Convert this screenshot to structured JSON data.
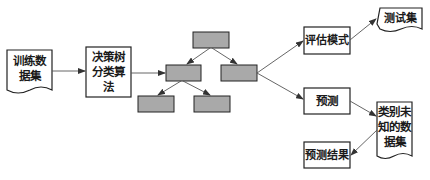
{
  "diagram": {
    "nodes": {
      "training_data": {
        "label": "训练数\n据集",
        "shape": "document"
      },
      "decision_tree_algo": {
        "label": "决策树\n分类算\n法",
        "shape": "rectangle"
      },
      "tree_root": {
        "label": "",
        "shape": "filled-rectangle"
      },
      "tree_left": {
        "label": "",
        "shape": "filled-rectangle"
      },
      "tree_right": {
        "label": "",
        "shape": "filled-rectangle"
      },
      "tree_left_left": {
        "label": "",
        "shape": "filled-rectangle"
      },
      "tree_left_right": {
        "label": "",
        "shape": "filled-rectangle"
      },
      "evaluate_model": {
        "label": "评估模式",
        "shape": "rectangle"
      },
      "test_set": {
        "label": "测试集",
        "shape": "document"
      },
      "predict": {
        "label": "预测",
        "shape": "rectangle"
      },
      "unknown_class_data": {
        "label": "类别未\n知的数\n据集",
        "shape": "document"
      },
      "prediction_result": {
        "label": "预测结果",
        "shape": "rectangle"
      }
    },
    "edges": [
      {
        "from": "training_data",
        "to": "decision_tree_algo"
      },
      {
        "from": "decision_tree_algo",
        "to": "tree_left"
      },
      {
        "from": "tree_root",
        "to": "tree_left"
      },
      {
        "from": "tree_root",
        "to": "tree_right"
      },
      {
        "from": "tree_left",
        "to": "tree_left_left"
      },
      {
        "from": "tree_left",
        "to": "tree_left_right"
      },
      {
        "from": "tree_right",
        "to": "evaluate_model"
      },
      {
        "from": "tree_right",
        "to": "predict"
      },
      {
        "from": "evaluate_model",
        "to": "test_set"
      },
      {
        "from": "predict",
        "to": "unknown_class_data"
      },
      {
        "from": "unknown_class_data",
        "to": "prediction_result"
      }
    ],
    "colors": {
      "stroke": "#222222",
      "tree_fill": "#a9a9a9",
      "edge": "#555555"
    }
  }
}
